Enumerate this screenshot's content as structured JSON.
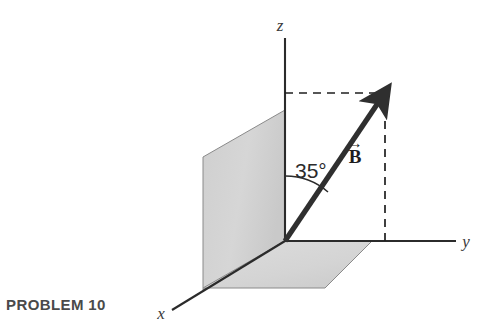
{
  "figure": {
    "caption": "PROBLEM 10",
    "axes": [
      {
        "name": "z-axis",
        "label": "z"
      },
      {
        "name": "y-axis",
        "label": "y"
      },
      {
        "name": "x-axis",
        "label": "x"
      }
    ],
    "angle": {
      "value": "35°",
      "measured_from": "z-axis",
      "measured_to": "B-vector"
    },
    "vector": {
      "symbol": "B",
      "overarrow": "→"
    },
    "planes": [
      {
        "name": "xz-plane-shaded",
        "fill": "#d4d4d4"
      },
      {
        "name": "xy-plane-shaded",
        "fill": "#d9d9d9"
      }
    ],
    "colors": {
      "background": "#ffffff",
      "axis_line": "#2b2b2b",
      "vector_line": "#2f2f2f",
      "dashed_line": "#1f1f1f",
      "plane_fill_vertical": "#d4d4d4",
      "plane_fill_horizontal": "#d9d9d9",
      "plane_stroke": "#7d7d7d",
      "caption_text": "#4a4a4a",
      "label_text": "#3a3a3a"
    }
  }
}
